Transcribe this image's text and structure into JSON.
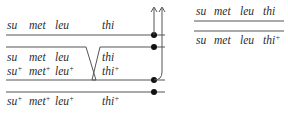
{
  "diagram": {
    "type": "genetic-recombination-crossover",
    "left": {
      "top_strand": {
        "genes": [
          "su",
          "met",
          "leu",
          "thi"
        ],
        "alleles": [
          "",
          "",
          "",
          ""
        ]
      },
      "crossover_pair": {
        "upper": {
          "genes": [
            "su",
            "met",
            "leu",
            "thi"
          ],
          "alleles": [
            "",
            "",
            "",
            ""
          ]
        },
        "lower": {
          "genes": [
            "su",
            "met",
            "leu",
            "thi"
          ],
          "alleles": [
            "+",
            "+",
            "+",
            "+"
          ]
        }
      },
      "bottom_strand": {
        "genes": [
          "su",
          "met",
          "leu",
          "thi"
        ],
        "alleles": [
          "+",
          "+",
          "+",
          "+"
        ]
      }
    },
    "right": {
      "products": [
        {
          "genes": [
            "su",
            "met",
            "leu",
            "thi"
          ],
          "alleles": [
            "",
            "",
            "",
            ""
          ]
        },
        {
          "genes": [
            "su",
            "met",
            "leu",
            "thi"
          ],
          "alleles": [
            "",
            "",
            "",
            "+"
          ]
        }
      ]
    },
    "colors": {
      "line": "#555555",
      "text": "#2a2a2a",
      "dot": "#111111"
    }
  }
}
